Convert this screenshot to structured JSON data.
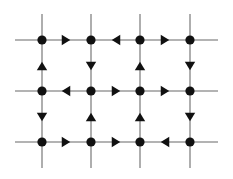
{
  "figure": {
    "background_color": "#ffffff",
    "line_color": "#9a9a9a",
    "node_color": "#111111",
    "arrow_color": "#111111",
    "node_radius": 4.6,
    "line_width": 1.6
  },
  "chart_data": {
    "type": "diagram",
    "columns": 4,
    "rows": 3,
    "column_x": [
      42,
      91,
      140,
      190
    ],
    "row_y": [
      40,
      91,
      142
    ],
    "stub_extent": {
      "left_x": 15,
      "right_x": 218,
      "top_y": 14,
      "bottom_y": 168
    },
    "nodes": [
      {
        "id": "n11",
        "row": 0,
        "col": 0,
        "x": 42,
        "y": 40
      },
      {
        "id": "n12",
        "row": 0,
        "col": 1,
        "x": 91,
        "y": 40
      },
      {
        "id": "n13",
        "row": 0,
        "col": 2,
        "x": 140,
        "y": 40
      },
      {
        "id": "n14",
        "row": 0,
        "col": 3,
        "x": 190,
        "y": 40
      },
      {
        "id": "n21",
        "row": 1,
        "col": 0,
        "x": 42,
        "y": 91
      },
      {
        "id": "n22",
        "row": 1,
        "col": 1,
        "x": 91,
        "y": 91
      },
      {
        "id": "n23",
        "row": 1,
        "col": 2,
        "x": 140,
        "y": 91
      },
      {
        "id": "n24",
        "row": 1,
        "col": 3,
        "x": 190,
        "y": 91
      },
      {
        "id": "n31",
        "row": 2,
        "col": 0,
        "x": 42,
        "y": 142
      },
      {
        "id": "n32",
        "row": 2,
        "col": 1,
        "x": 91,
        "y": 142
      },
      {
        "id": "n33",
        "row": 2,
        "col": 2,
        "x": 140,
        "y": 142
      },
      {
        "id": "n34",
        "row": 2,
        "col": 3,
        "x": 190,
        "y": 142
      }
    ],
    "horizontal_arrows": [
      {
        "id": "h-r1-c1",
        "row": 0,
        "between": [
          "n11",
          "n12"
        ],
        "direction": "right",
        "x": 66,
        "y": 40
      },
      {
        "id": "h-r1-c2",
        "row": 0,
        "between": [
          "n12",
          "n13"
        ],
        "direction": "left",
        "x": 116,
        "y": 40
      },
      {
        "id": "h-r1-c3",
        "row": 0,
        "between": [
          "n13",
          "n14"
        ],
        "direction": "right",
        "x": 165,
        "y": 40
      },
      {
        "id": "h-r2-c1",
        "row": 1,
        "between": [
          "n21",
          "n22"
        ],
        "direction": "left",
        "x": 66,
        "y": 91
      },
      {
        "id": "h-r2-c2",
        "row": 1,
        "between": [
          "n22",
          "n23"
        ],
        "direction": "right",
        "x": 116,
        "y": 91
      },
      {
        "id": "h-r2-c3",
        "row": 1,
        "between": [
          "n23",
          "n24"
        ],
        "direction": "right",
        "x": 165,
        "y": 91
      },
      {
        "id": "h-r3-c1",
        "row": 2,
        "between": [
          "n31",
          "n32"
        ],
        "direction": "right",
        "x": 66,
        "y": 142
      },
      {
        "id": "h-r3-c2",
        "row": 2,
        "between": [
          "n32",
          "n33"
        ],
        "direction": "right",
        "x": 116,
        "y": 142
      },
      {
        "id": "h-r3-c3",
        "row": 2,
        "between": [
          "n33",
          "n34"
        ],
        "direction": "left",
        "x": 165,
        "y": 142
      }
    ],
    "vertical_arrows": [
      {
        "id": "v-c1-r1",
        "col": 0,
        "between": [
          "n11",
          "n21"
        ],
        "direction": "up",
        "x": 42,
        "y": 66
      },
      {
        "id": "v-c2-r1",
        "col": 1,
        "between": [
          "n12",
          "n22"
        ],
        "direction": "down",
        "x": 91,
        "y": 66
      },
      {
        "id": "v-c3-r1",
        "col": 2,
        "between": [
          "n13",
          "n23"
        ],
        "direction": "up",
        "x": 140,
        "y": 66
      },
      {
        "id": "v-c4-r1",
        "col": 3,
        "between": [
          "n14",
          "n24"
        ],
        "direction": "down",
        "x": 190,
        "y": 66
      },
      {
        "id": "v-c1-r2",
        "col": 0,
        "between": [
          "n21",
          "n31"
        ],
        "direction": "down",
        "x": 42,
        "y": 117
      },
      {
        "id": "v-c2-r2",
        "col": 1,
        "between": [
          "n22",
          "n32"
        ],
        "direction": "up",
        "x": 91,
        "y": 117
      },
      {
        "id": "v-c3-r2",
        "col": 2,
        "between": [
          "n23",
          "n33"
        ],
        "direction": "up",
        "x": 140,
        "y": 117
      },
      {
        "id": "v-c4-r2",
        "col": 3,
        "between": [
          "n24",
          "n34"
        ],
        "direction": "down",
        "x": 190,
        "y": 117
      }
    ]
  }
}
